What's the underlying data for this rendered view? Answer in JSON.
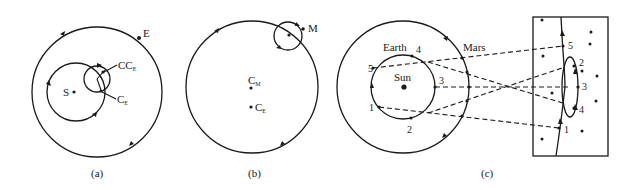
{
  "figure": {
    "panels": [
      {
        "id": "a",
        "caption": "(a)",
        "labels": {
          "earth": "E",
          "sun": "S",
          "epicycle_center": "CC",
          "epicycle_center_sub": "E",
          "deferent_center": "C",
          "deferent_center_sub": "E"
        }
      },
      {
        "id": "b",
        "caption": "(b)",
        "labels": {
          "moon": "M",
          "moon_center": "C",
          "moon_center_sub": "M",
          "earth_center": "C",
          "earth_center_sub": "E"
        }
      },
      {
        "id": "c",
        "caption": "(c)",
        "labels": {
          "earth": "Earth",
          "mars": "Mars",
          "sun": "Sun"
        },
        "earth_positions": [
          "1",
          "2",
          "3",
          "4",
          "5"
        ],
        "sky_positions": [
          "1",
          "2",
          "3",
          "4",
          "5"
        ]
      }
    ],
    "colors": {
      "ink": "#1a1a1a",
      "background": "#ffffff"
    }
  }
}
